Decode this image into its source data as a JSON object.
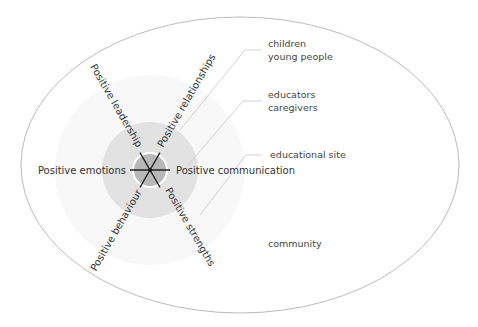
{
  "diagram": {
    "type": "nested-ecological-model",
    "center": {
      "dimensions": [
        {
          "label": "Positive leadership",
          "angle": -120
        },
        {
          "label": "Positive relationships",
          "angle": -60
        },
        {
          "label": "Positive communication",
          "angle": 0
        },
        {
          "label": "Positive strengths",
          "angle": 60
        },
        {
          "label": "Positive behaviour",
          "angle": 120
        },
        {
          "label": "Positive emotions",
          "angle": 180
        }
      ]
    },
    "layers": [
      {
        "label_line1": "children",
        "label_line2": "young people"
      },
      {
        "label_line1": "educators",
        "label_line2": "caregivers"
      },
      {
        "label_line1": "educational site",
        "label_line2": ""
      },
      {
        "label_line1": "community",
        "label_line2": ""
      }
    ],
    "colors": {
      "inner_circle": "#b8b8b8",
      "ring": "#e2e2e2",
      "outer_ellipse_stroke": "#bbbbbb",
      "spokes": "#222222",
      "leader_lines": "#c8c8c8"
    }
  }
}
